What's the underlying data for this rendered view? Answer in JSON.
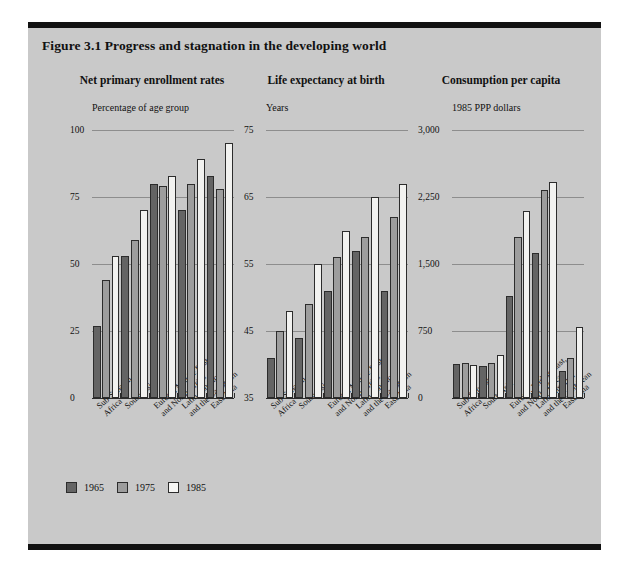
{
  "figure": {
    "title": "Figure 3.1  Progress and stagnation in the developing world"
  },
  "legend": {
    "items": [
      {
        "label": "1965",
        "color": "#646464"
      },
      {
        "label": "1975",
        "color": "#9d9d9d"
      },
      {
        "label": "1985",
        "color": "#f2f2f0"
      }
    ]
  },
  "categories": [
    "Sub-Saharan\nAfrica",
    "South Asia",
    "Europe, Middle East,\nand North Africa",
    "Latin America\nand the Caribbean",
    "East Asia"
  ],
  "chart_data": [
    {
      "type": "bar",
      "title": "Net primary enrollment rates",
      "ylabel": "Percentage of age group",
      "xlabel": "",
      "ylim": [
        0,
        100
      ],
      "yticks": [
        0,
        25,
        50,
        75,
        100
      ],
      "ytick_labels": [
        "0",
        "25",
        "50",
        "75",
        "100"
      ],
      "grid": true,
      "legend_position": "bottom-left",
      "categories": [
        "Sub-Saharan Africa",
        "South Asia",
        "Europe, Middle East, and North Africa",
        "Latin America and the Caribbean",
        "East Asia"
      ],
      "series": [
        {
          "name": "1965",
          "values": [
            27,
            53,
            80,
            70,
            83
          ]
        },
        {
          "name": "1975",
          "values": [
            44,
            59,
            79,
            80,
            78
          ]
        },
        {
          "name": "1985",
          "values": [
            53,
            70,
            83,
            89,
            95
          ]
        }
      ]
    },
    {
      "type": "bar",
      "title": "Life expectancy at birth",
      "ylabel": "Years",
      "xlabel": "",
      "ylim": [
        35,
        75
      ],
      "yticks": [
        35,
        45,
        55,
        65,
        75
      ],
      "ytick_labels": [
        "35",
        "45",
        "55",
        "65",
        "75"
      ],
      "grid": true,
      "legend_position": "bottom-left",
      "categories": [
        "Sub-Saharan Africa",
        "South Asia",
        "Europe, Middle East, and North Africa",
        "Latin America and the Caribbean",
        "East Asia"
      ],
      "series": [
        {
          "name": "1965",
          "values": [
            41,
            44,
            51,
            57,
            51
          ]
        },
        {
          "name": "1975",
          "values": [
            45,
            49,
            56,
            59,
            62
          ]
        },
        {
          "name": "1985",
          "values": [
            48,
            55,
            60,
            65,
            67
          ]
        }
      ]
    },
    {
      "type": "bar",
      "title": "Consumption per capita",
      "ylabel": "1985 PPP dollars",
      "xlabel": "",
      "ylim": [
        0,
        3000
      ],
      "yticks": [
        0,
        750,
        1500,
        2250,
        3000
      ],
      "ytick_labels": [
        "0",
        "750",
        "1,500",
        "2,250",
        "3,000"
      ],
      "grid": true,
      "legend_position": "bottom-left",
      "categories": [
        "Sub-Saharan Africa",
        "South Asia",
        "Europe, Middle East, and North Africa",
        "Latin America and the Caribbean",
        "East Asia"
      ],
      "series": [
        {
          "name": "1965",
          "values": [
            380,
            360,
            1140,
            1620,
            300
          ]
        },
        {
          "name": "1975",
          "values": [
            390,
            390,
            1800,
            2330,
            450
          ]
        },
        {
          "name": "1985",
          "values": [
            370,
            480,
            2090,
            2420,
            800
          ]
        }
      ]
    }
  ]
}
